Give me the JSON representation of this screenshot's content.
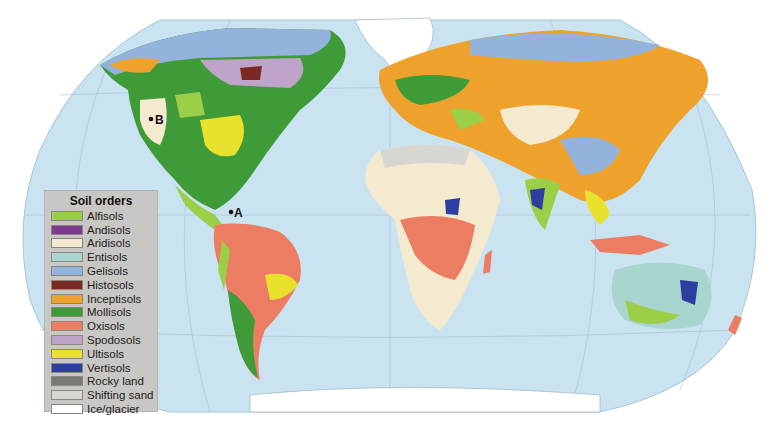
{
  "map": {
    "title": "World soil orders map",
    "projection": "Robinson-like world projection",
    "colors": {
      "ocean": "#c9e3f1",
      "graticule": "#9fb9c8",
      "outline": "#aac7d8"
    },
    "markers": [
      {
        "id": "A",
        "label": "A",
        "region": "Amazon basin, South America"
      },
      {
        "id": "B",
        "label": "B",
        "region": "Western United States, North America"
      }
    ]
  },
  "legend": {
    "title": "Soil orders",
    "items": [
      {
        "label": "Alfisols",
        "color": "#9ccf48"
      },
      {
        "label": "Andisols",
        "color": "#7e3a8e"
      },
      {
        "label": "Aridisols",
        "color": "#f3ead0"
      },
      {
        "label": "Entisols",
        "color": "#a8d5ce"
      },
      {
        "label": "Gelisols",
        "color": "#93b3dc"
      },
      {
        "label": "Histosols",
        "color": "#7a2a22"
      },
      {
        "label": "Inceptisols",
        "color": "#eea22c"
      },
      {
        "label": "Mollisols",
        "color": "#3f9a38"
      },
      {
        "label": "Oxisols",
        "color": "#ec7d62"
      },
      {
        "label": "Spodosols",
        "color": "#c0a3c9"
      },
      {
        "label": "Ultisols",
        "color": "#e9e22d"
      },
      {
        "label": "Vertisols",
        "color": "#2c3ea0"
      },
      {
        "label": "Rocky land",
        "color": "#7b7a77"
      },
      {
        "label": "Shifting sand",
        "color": "#d8d6d1"
      },
      {
        "label": "Ice/glacier",
        "color": "#ffffff"
      }
    ]
  }
}
